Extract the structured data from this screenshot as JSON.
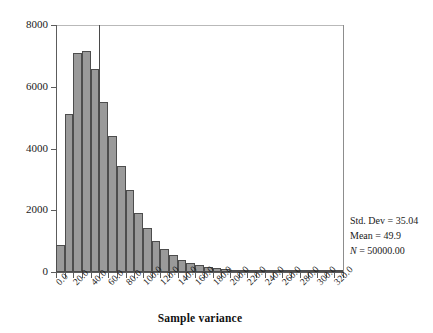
{
  "chart_data": {
    "type": "bar",
    "title": "",
    "xlabel": "Sample variance",
    "ylabel": "",
    "xlim": [
      0,
      330
    ],
    "ylim": [
      0,
      8000
    ],
    "bin_width": 10,
    "grid": false,
    "legend_position": "none",
    "bar_color": "#9a9a9a",
    "bar_edge_color": "#4d4d4d",
    "x_tick_labels": [
      "0.0",
      "20.0",
      "40.0",
      "60.0",
      "80.0",
      "100.0",
      "120.0",
      "140.0",
      "160.0",
      "180.0",
      "200.0",
      "220.0",
      "240.0",
      "260.0",
      "280.0",
      "300.0",
      "320.0"
    ],
    "x_tick_values": [
      0,
      20,
      40,
      60,
      80,
      100,
      120,
      140,
      160,
      180,
      200,
      220,
      240,
      260,
      280,
      300,
      320
    ],
    "y_tick_labels": [
      "0",
      "2000",
      "4000",
      "6000",
      "8000"
    ],
    "y_tick_values": [
      0,
      2000,
      4000,
      6000,
      8000
    ],
    "bin_starts": [
      0,
      10,
      20,
      30,
      40,
      50,
      60,
      70,
      80,
      90,
      100,
      110,
      120,
      130,
      140,
      150,
      160,
      170,
      180,
      190,
      200,
      210,
      220,
      230,
      240,
      250,
      260,
      270,
      280,
      290,
      300,
      310,
      320
    ],
    "values": [
      880,
      5120,
      7100,
      7150,
      6560,
      5520,
      4400,
      3430,
      2650,
      1900,
      1430,
      1000,
      760,
      540,
      400,
      300,
      220,
      160,
      120,
      85,
      60,
      42,
      30,
      20,
      14,
      10,
      7,
      5,
      3,
      2,
      2,
      1,
      1
    ],
    "mean_line_value": 49.9
  },
  "stats": {
    "std_dev": "Std. Dev = 35.04",
    "mean": "Mean = 49.9",
    "n_symbol": "N",
    "n_value": " = 50000.00"
  },
  "axis": {
    "x_title": "Sample variance"
  }
}
